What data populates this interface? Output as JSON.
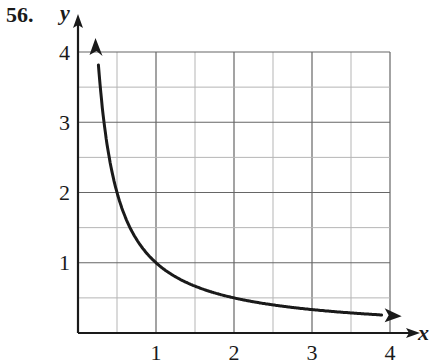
{
  "problem_number": "56.",
  "chart_data": {
    "type": "line",
    "title": "",
    "xlabel": "x",
    "ylabel": "y",
    "xlim": [
      0,
      4
    ],
    "ylim": [
      0,
      4
    ],
    "x_ticks": [
      "1",
      "2",
      "3",
      "4"
    ],
    "y_ticks": [
      "1",
      "2",
      "3",
      "4"
    ],
    "grid": true,
    "minor_grid_step": 0.5,
    "function": "y = 1/x",
    "series": [
      {
        "name": "y = 1/x",
        "x": [
          0.25,
          0.3,
          0.4,
          0.5,
          0.6,
          0.75,
          1,
          1.25,
          1.5,
          2,
          2.5,
          3,
          3.5,
          3.95
        ],
        "y": [
          4,
          3.33,
          2.5,
          2,
          1.67,
          1.33,
          1,
          0.8,
          0.67,
          0.5,
          0.4,
          0.33,
          0.29,
          0.25
        ],
        "arrows": "both ends"
      }
    ],
    "colors": {
      "axis": "#1a1a1a",
      "grid_major": "#666666",
      "grid_minor": "#b5b5b5",
      "curve": "#1a1a1a"
    }
  }
}
